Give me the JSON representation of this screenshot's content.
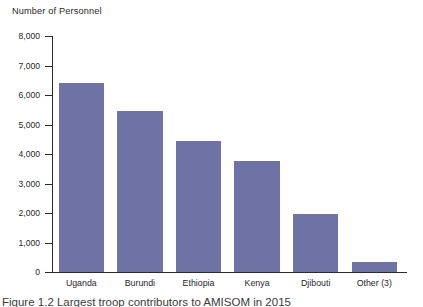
{
  "chart_data": {
    "type": "bar",
    "title": "Number of Personnel",
    "xlabel": "",
    "ylabel": "Number of Personnel",
    "categories": [
      "Uganda",
      "Burundi",
      "Ethiopia",
      "Kenya",
      "Djibouti",
      "Other (3)"
    ],
    "values": [
      6400,
      5450,
      4450,
      3750,
      1950,
      350
    ],
    "ylim": [
      0,
      8000
    ],
    "y_ticks": [
      0,
      1000,
      2000,
      3000,
      4000,
      5000,
      6000,
      7000,
      8000
    ],
    "y_tick_labels": [
      "0",
      "1,000",
      "2,000",
      "3,000",
      "4,000",
      "5,000",
      "6,000",
      "7,000",
      "8,000"
    ],
    "grid": false,
    "legend": false,
    "bar_color": "#6f72a5",
    "axis_color": "#2b2b2b",
    "background": "#ffffff",
    "caption": "Figure 1.2  Largest troop contributors to AMISOM in 2015"
  },
  "axis": {
    "title": "Number of Personnel"
  }
}
